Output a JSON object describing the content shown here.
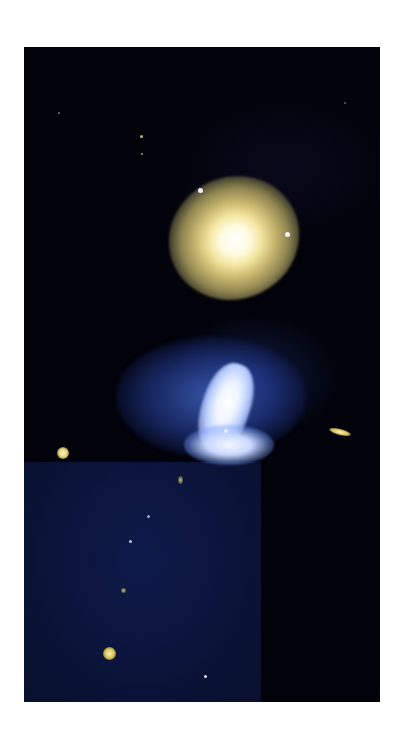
{
  "image": {
    "subject": "interacting galaxy pair",
    "background_color": "#ffffff",
    "frame": {
      "x": 24,
      "y": 47,
      "width": 356,
      "height": 655
    },
    "colors": {
      "sky": "#02020a",
      "lower_left_chip": "#0a1338",
      "upper_galaxy_core": "#fffbe0",
      "upper_galaxy_halo": "#c9b870",
      "lower_galaxy_arms": "#4670d2",
      "lower_galaxy_core": "#eef4ff"
    },
    "objects": [
      {
        "name": "yellow-elliptical-galaxy",
        "cx": 210,
        "cy": 191
      },
      {
        "name": "blue-spiral-galaxy",
        "cx": 200,
        "cy": 350
      },
      {
        "name": "edge-on-galaxy",
        "cx": 316,
        "cy": 385
      },
      {
        "name": "yellow-star-left",
        "cx": 40,
        "cy": 406
      },
      {
        "name": "yellow-star-bottom",
        "cx": 86,
        "cy": 607
      }
    ]
  }
}
